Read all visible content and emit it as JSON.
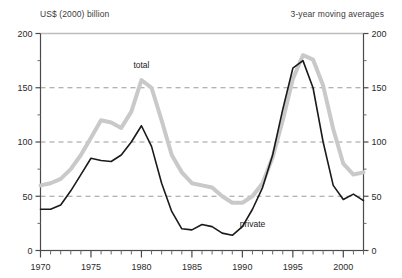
{
  "header": {
    "units_label": "US$ (2000) billion",
    "note_label": "3-year moving averages"
  },
  "chart_data": {
    "type": "line",
    "title": "",
    "subtitle": "",
    "xlabel": "",
    "ylabel": "US$ (2000) billion",
    "annotation": "3-year moving averages",
    "grid": true,
    "grid_values": [
      50,
      100,
      150,
      200
    ],
    "legend_position": "inline-annotation",
    "xlim": [
      1970,
      2002
    ],
    "ylim": [
      0,
      200
    ],
    "y_ticks": [
      0,
      50,
      100,
      150,
      200
    ],
    "y_tick_labels": [
      "0",
      "50",
      "100",
      "150",
      "200"
    ],
    "y_minor_ticks": [
      25,
      75,
      125,
      175
    ],
    "x_ticks": [
      1970,
      1975,
      1980,
      1985,
      1990,
      1995,
      2000
    ],
    "x_tick_labels": [
      "1970",
      "1975",
      "1980",
      "1985",
      "1990",
      "1995",
      "2000"
    ],
    "x_minor_ticks": [
      1971,
      1972,
      1973,
      1974,
      1976,
      1977,
      1978,
      1979,
      1981,
      1982,
      1983,
      1984,
      1986,
      1987,
      1988,
      1989,
      1991,
      1992,
      1993,
      1994,
      1996,
      1997,
      1998,
      1999,
      2001,
      2002
    ],
    "dual_y_axis": true,
    "x": [
      1970,
      1971,
      1972,
      1973,
      1974,
      1975,
      1976,
      1977,
      1978,
      1979,
      1980,
      1981,
      1982,
      1983,
      1984,
      1985,
      1986,
      1987,
      1988,
      1989,
      1990,
      1991,
      1992,
      1993,
      1994,
      1995,
      1996,
      1997,
      1998,
      1999,
      2000,
      2001,
      2002
    ],
    "series": [
      {
        "name": "total",
        "color": "#c9c9c9",
        "width": 4,
        "label_x": 1980,
        "label_y": 168,
        "values": [
          60,
          62,
          66,
          75,
          88,
          104,
          120,
          118,
          113,
          128,
          157,
          150,
          120,
          88,
          72,
          62,
          60,
          58,
          50,
          44,
          44,
          50,
          62,
          86,
          120,
          158,
          180,
          176,
          152,
          112,
          80,
          70,
          72
        ]
      },
      {
        "name": "private",
        "color": "#1a1a1a",
        "width": 1.6,
        "label_x": 1991,
        "label_y": 22,
        "values": [
          38,
          38,
          42,
          55,
          70,
          85,
          83,
          82,
          88,
          100,
          115,
          96,
          62,
          36,
          20,
          19,
          24,
          22,
          16,
          14,
          22,
          38,
          58,
          88,
          130,
          168,
          175,
          150,
          100,
          60,
          47,
          52,
          46
        ]
      }
    ]
  }
}
